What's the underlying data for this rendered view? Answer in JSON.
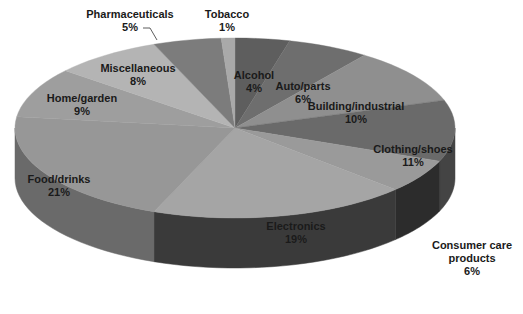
{
  "chart_data": {
    "type": "pie",
    "title": "",
    "style": "3d-pie",
    "start_angle_deg": 0,
    "direction": "clockwise",
    "categories": [
      "Alcohol",
      "Auto/parts",
      "Building/industrial",
      "Clothing/shoes",
      "Consumer care products",
      "Electronics",
      "Food/drinks",
      "Home/garden",
      "Miscellaneous",
      "Pharmaceuticals",
      "Tobacco"
    ],
    "values": [
      4,
      6,
      10,
      11,
      6,
      19,
      21,
      9,
      8,
      5,
      1
    ],
    "unit": "%",
    "slices": [
      {
        "label": "Alcohol",
        "value": 4,
        "pct": "4%",
        "color": "#5e5e5e",
        "side": "#3e3e3e",
        "lx": 254,
        "ly": 79,
        "lines": [
          "Alcohol",
          "4%"
        ]
      },
      {
        "label": "Auto/parts",
        "value": 6,
        "pct": "6%",
        "color": "#6e6e6e",
        "side": "#4a4a4a",
        "lx": 303,
        "ly": 90,
        "lines": [
          "Auto/parts",
          "6%"
        ]
      },
      {
        "label": "Building/industrial",
        "value": 10,
        "pct": "10%",
        "color": "#8f8f8f",
        "side": "#5c5c5c",
        "lx": 356,
        "ly": 110,
        "lines": [
          "Building/industrial",
          "10%"
        ]
      },
      {
        "label": "Clothing/shoes",
        "value": 11,
        "pct": "11%",
        "color": "#6a6a6a",
        "side": "#444444",
        "lx": 413,
        "ly": 153,
        "lines": [
          "Clothing/shoes",
          "11%"
        ]
      },
      {
        "label": "Consumer care products",
        "value": 6,
        "pct": "6%",
        "color": "#9a9a9a",
        "side": "#2c2c2c",
        "lx": 472,
        "ly": 249,
        "lines": [
          "Consumer care",
          "products",
          "6%"
        ]
      },
      {
        "label": "Electronics",
        "value": 19,
        "pct": "19%",
        "color": "#a5a5a5",
        "side": "#3a3a3a",
        "lx": 296,
        "ly": 230,
        "lines": [
          "Electronics",
          "19%"
        ]
      },
      {
        "label": "Food/drinks",
        "value": 21,
        "pct": "21%",
        "color": "#979797",
        "side": "#6a6a6a",
        "lx": 59,
        "ly": 183,
        "lines": [
          "Food/drinks",
          "21%"
        ]
      },
      {
        "label": "Home/garden",
        "value": 9,
        "pct": "9%",
        "color": "#9e9e9e",
        "side": "#707070",
        "lx": 82,
        "ly": 102,
        "lines": [
          "Home/garden",
          "9%"
        ]
      },
      {
        "label": "Miscellaneous",
        "value": 8,
        "pct": "8%",
        "color": "#b4b4b4",
        "side": "#808080",
        "lx": 138,
        "ly": 72,
        "lines": [
          "Miscellaneous",
          "8%"
        ]
      },
      {
        "label": "Pharmaceuticals",
        "value": 5,
        "pct": "5%",
        "color": "#7c7c7c",
        "side": "#555555",
        "lx": 130,
        "ly": 18,
        "lines": [
          "Pharmaceuticals",
          "5%"
        ],
        "leader": true
      },
      {
        "label": "Tobacco",
        "value": 1,
        "pct": "1%",
        "color": "#a9a9a9",
        "side": "#7a7a7a",
        "lx": 227,
        "ly": 18,
        "lines": [
          "Tobacco",
          "1%"
        ]
      }
    ],
    "geometry": {
      "cx": 235,
      "cy": 128,
      "rx": 220,
      "ry": 90,
      "depth": 50
    },
    "legend": "none",
    "labels": "data labels (category name + percentage)"
  }
}
